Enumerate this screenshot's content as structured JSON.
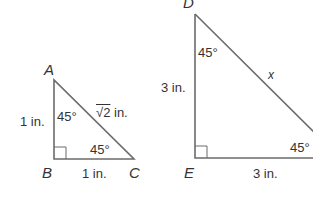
{
  "triangles": [
    {
      "name": "ABC",
      "vertices": {
        "A": "A",
        "B": "B",
        "C": "C"
      },
      "sides": {
        "AB": "1 in.",
        "BC": "1 in.",
        "AC_radical": "√2",
        "AC_unit": " in."
      },
      "angles": {
        "A": "45°",
        "C": "45°"
      },
      "right_angle_at": "B"
    },
    {
      "name": "DEF",
      "vertices": {
        "D": "D",
        "E": "E"
      },
      "sides": {
        "DE": "3 in.",
        "EF": "3 in.",
        "DF": "x"
      },
      "angles": {
        "D": "45°",
        "F": "45°"
      },
      "right_angle_at": "E"
    }
  ],
  "colors": {
    "line": "#6b6b6b",
    "text": "#333333"
  }
}
